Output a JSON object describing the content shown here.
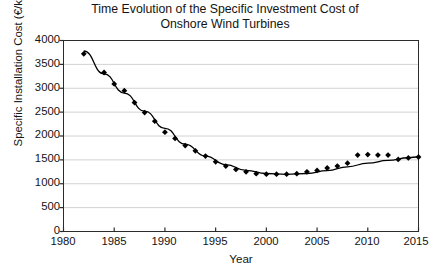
{
  "chart_data": {
    "type": "scatter",
    "title": "Time Evolution of the Specific Investment Cost of\nOnshore Wind Turbines",
    "xlabel": "Year",
    "ylabel": "Specific Installation Cost (€/kW)",
    "xlim": [
      1980,
      2015
    ],
    "ylim": [
      0,
      4000
    ],
    "xticks": [
      1980,
      1985,
      1990,
      1995,
      2000,
      2005,
      2010,
      2015
    ],
    "yticks": [
      0,
      500,
      1000,
      1500,
      2000,
      2500,
      3000,
      3500,
      4000
    ],
    "grid": "horizontal",
    "legend": "none",
    "marker": "filled-diamond",
    "marker_color": "#000000",
    "line_color": "#000000",
    "series": [
      {
        "name": "Specific installation cost",
        "x": [
          1982,
          1984,
          1985,
          1986,
          1987,
          1988,
          1989,
          1990,
          1991,
          1992,
          1993,
          1994,
          1995,
          1996,
          1997,
          1998,
          1999,
          2000,
          2001,
          2002,
          2003,
          2004,
          2005,
          2006,
          2007,
          2008,
          2009,
          2010,
          2011,
          2012,
          2013,
          2014,
          2015
        ],
        "y": [
          3720,
          3330,
          3090,
          2950,
          2700,
          2490,
          2310,
          2080,
          1950,
          1800,
          1690,
          1580,
          1460,
          1370,
          1300,
          1250,
          1210,
          1200,
          1200,
          1200,
          1210,
          1250,
          1280,
          1330,
          1370,
          1430,
          1600,
          1610,
          1600,
          1600,
          1510,
          1540,
          1560
        ]
      }
    ],
    "trend_line": {
      "name": "fitted trend curve",
      "x": [
        1982,
        1984,
        1986,
        1988,
        1990,
        1992,
        1994,
        1996,
        1998,
        2000,
        2002,
        2004,
        2006,
        2008,
        2010,
        2012,
        2014,
        2015
      ],
      "y": [
        3780,
        3300,
        2900,
        2520,
        2160,
        1830,
        1580,
        1400,
        1280,
        1215,
        1195,
        1215,
        1275,
        1355,
        1430,
        1490,
        1545,
        1565
      ]
    }
  }
}
